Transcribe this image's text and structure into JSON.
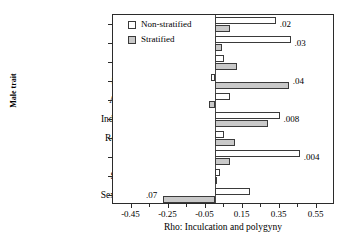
{
  "chart_data": {
    "type": "bar",
    "orientation": "horizontal",
    "title": "",
    "xlabel": "Rho: Inculcation and polygyny",
    "ylabel": "Male trait",
    "grid": false,
    "legend_position": "top-left-inside",
    "xlim": [
      -0.55,
      0.65
    ],
    "xticks": [
      -0.45,
      -0.25,
      -0.05,
      0.15,
      0.35,
      0.55
    ],
    "xtick_labels": [
      "-0.45",
      "-0.25",
      "-0.05",
      "0.15",
      "0.35",
      "0.55"
    ],
    "categories": [
      "Fortitude",
      "Aggression",
      "Competition",
      "Self-reliance",
      "Achievement",
      "Industriousness",
      "Responsibility",
      "Obedience",
      "Self-restraint",
      "Sexual restraint"
    ],
    "series": [
      {
        "name": "Non-stratified",
        "color": "#ffffff",
        "values": [
          0.33,
          0.41,
          0.05,
          -0.02,
          0.08,
          0.35,
          0.05,
          0.46,
          0.03,
          0.19
        ]
      },
      {
        "name": "Stratified",
        "color": "#c9c9c9",
        "values": [
          0.08,
          0.04,
          0.12,
          0.4,
          -0.03,
          0.29,
          0.11,
          0.08,
          0.01,
          -0.28
        ]
      }
    ],
    "annotations": [
      {
        "category": "Fortitude",
        "text": ".02",
        "value": 0.02
      },
      {
        "category": "Aggression",
        "text": ".03",
        "value": 0.03
      },
      {
        "category": "Self-reliance",
        "text": ".04",
        "value": 0.04
      },
      {
        "category": "Industriousness",
        "text": ".008",
        "value": 0.008
      },
      {
        "category": "Obedience",
        "text": ".004",
        "value": 0.004
      },
      {
        "category": "Sexual restraint",
        "text": ".07",
        "value": 0.07
      }
    ]
  },
  "legend": {
    "items": [
      {
        "label": "Non-stratified"
      },
      {
        "label": "Stratified"
      }
    ]
  },
  "axes": {
    "y_title": "Male trait",
    "x_title": "Rho: Inculcation and polygyny"
  }
}
